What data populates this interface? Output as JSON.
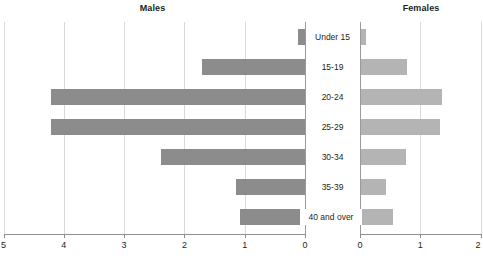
{
  "chart_data": {
    "type": "bar",
    "subtype": "population-pyramid",
    "title": "",
    "categories": [
      "Under 15",
      "15-19",
      "20-24",
      "25-29",
      "30-34",
      "35-39",
      "40 and over"
    ],
    "series": [
      {
        "name": "Males",
        "axis": "left",
        "color": "#8c8c8c",
        "values": [
          0.12,
          1.7,
          4.21,
          4.21,
          2.39,
          1.15,
          1.07
        ]
      },
      {
        "name": "Females",
        "axis": "right",
        "color": "#b4b4b4",
        "values": [
          0.08,
          0.77,
          1.35,
          1.31,
          0.74,
          0.41,
          0.53
        ]
      }
    ],
    "left_axis": {
      "label": "Males",
      "ticks": [
        "5",
        "4",
        "3",
        "2",
        "1",
        "0"
      ],
      "tick_values": [
        5,
        4,
        3,
        2,
        1,
        0
      ],
      "lim": [
        5,
        0
      ],
      "reversed": true
    },
    "right_axis": {
      "label": "Females",
      "ticks": [
        "0",
        "1",
        "2"
      ],
      "tick_values": [
        0,
        1,
        2
      ],
      "lim": [
        0,
        2
      ],
      "reversed": false
    },
    "xlabel": "",
    "ylabel": "",
    "grid": true,
    "legend": "none",
    "colors": {
      "males_bar": "#8c8c8c",
      "females_bar": "#b4b4b4",
      "gridline": "#d9d9d9",
      "axis": "#8e8e8e",
      "text": "#231f20",
      "background": "#ffffff"
    }
  },
  "panels": {
    "males_title": "Males",
    "females_title": "Females"
  }
}
